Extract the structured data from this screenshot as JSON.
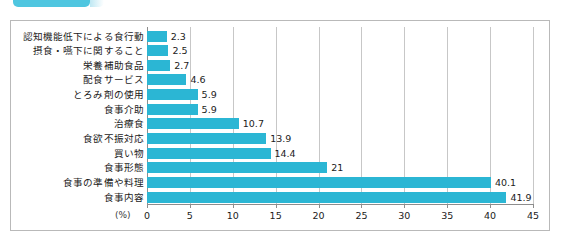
{
  "banner": {
    "name": "tab-banner",
    "color": "#4fc6e0"
  },
  "chart_data": {
    "type": "bar",
    "orientation": "horizontal",
    "title": "",
    "xlabel": "(%)",
    "ylabel": "",
    "unit": "(%)",
    "xlim": [
      0,
      45
    ],
    "xticks": [
      0,
      5,
      10,
      15,
      20,
      25,
      30,
      35,
      40,
      45
    ],
    "xtick_labels": [
      "0",
      "5",
      "10",
      "15",
      "20",
      "25",
      "30",
      "35",
      "40",
      "45"
    ],
    "grid": true,
    "legend": false,
    "bar_color": "#2bb6d4",
    "categories": [
      "認知機能低下による食行動",
      "摂食・嚥下に関すること",
      "栄養補助食品",
      "配食サービス",
      "とろみ剤の使用",
      "食事介助",
      "治療食",
      "食欲不振対応",
      "買い物",
      "食事形態",
      "食事の準備や料理",
      "食事内容"
    ],
    "values": [
      2.3,
      2.5,
      2.7,
      4.6,
      5.9,
      5.9,
      10.7,
      13.9,
      14.4,
      21,
      40.1,
      41.9
    ],
    "value_labels": [
      "2.3",
      "2.5",
      "2.7",
      "4.6",
      "5.9",
      "5.9",
      "10.7",
      "13.9",
      "14.4",
      "21",
      "40.1",
      "41.9"
    ]
  }
}
